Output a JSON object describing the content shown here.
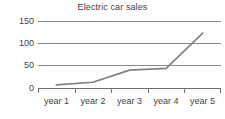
{
  "chart_data": {
    "type": "line",
    "title": "Electric car sales",
    "xlabel": "",
    "ylabel": "",
    "categories": [
      "year 1",
      "year 2",
      "year 3",
      "year 4",
      "year 5"
    ],
    "values": [
      7,
      13,
      40,
      44,
      123
    ],
    "series": [
      {
        "name": "Electric car sales",
        "values": [
          7,
          13,
          40,
          44,
          123
        ]
      }
    ],
    "ylim": [
      0,
      150
    ],
    "yticks": [
      0,
      50,
      100,
      150
    ],
    "ytick_labels": [
      "0",
      "50",
      "100",
      "150"
    ],
    "grid": true,
    "legend": false,
    "legend_position": "none",
    "line_color": "#808080",
    "grid_color": "#8a8a8a",
    "axis_color": "#6f6f6f",
    "text_color": "#3f3f3f",
    "background_color": "#ffffff"
  }
}
